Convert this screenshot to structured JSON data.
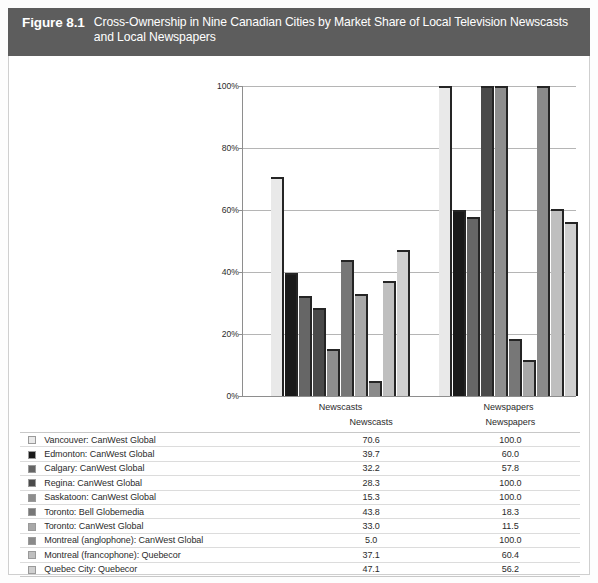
{
  "header": {
    "figure_number": "Figure 8.1",
    "title": "Cross-Ownership in Nine Canadian Cities by Market Share of Local Television Newscasts and Local Newspapers",
    "background_color": "#5d5d5d",
    "text_color": "#ffffff"
  },
  "table": {
    "columns": [
      "",
      "",
      "Newscasts",
      "Newspapers"
    ],
    "newscasts_header": "Newscasts",
    "newspapers_header": "Newspapers",
    "rows": [
      {
        "swatch": "#e9e9e9",
        "label": "Vancouver: CanWest Global",
        "newscasts": "70.6",
        "newspapers": "100.0"
      },
      {
        "swatch": "#1a1a1a",
        "label": "Edmonton: CanWest Global",
        "newscasts": "39.7",
        "newspapers": "60.0"
      },
      {
        "swatch": "#666666",
        "label": "Calgary: CanWest Global",
        "newscasts": "32.2",
        "newspapers": "57.8"
      },
      {
        "swatch": "#4a4a4a",
        "label": "Regina: CanWest Global",
        "newscasts": "28.3",
        "newspapers": "100.0"
      },
      {
        "swatch": "#8e8e8e",
        "label": "Saskatoon: CanWest Global",
        "newscasts": "15.3",
        "newspapers": "100.0"
      },
      {
        "swatch": "#777777",
        "label": "Toronto: Bell Globemedia",
        "newscasts": "43.8",
        "newspapers": "18.3"
      },
      {
        "swatch": "#a8a8a8",
        "label": "Toronto: CanWest Global",
        "newscasts": "33.0",
        "newspapers": "11.5"
      },
      {
        "swatch": "#8a8a8a",
        "label": "Montreal (anglophone): CanWest Global",
        "newscasts": "5.0",
        "newspapers": "100.0"
      },
      {
        "swatch": "#bfbfbf",
        "label": "Montreal (francophone): Quebecor",
        "newscasts": "37.1",
        "newspapers": "60.4"
      },
      {
        "swatch": "#cfcfcf",
        "label": "Quebec City: Quebecor",
        "newscasts": "47.1",
        "newspapers": "56.2"
      }
    ]
  },
  "chart_data": {
    "type": "bar",
    "title": "Cross-Ownership in Nine Canadian Cities by Market Share of Local Television Newscasts and Local Newspapers",
    "xlabel": "",
    "ylabel": "",
    "categories": [
      "Newscasts",
      "Newspapers"
    ],
    "ylim": [
      0,
      100
    ],
    "ytick_labels": [
      "0%",
      "20%",
      "40%",
      "60%",
      "80%",
      "100%"
    ],
    "ytick_values": [
      0,
      20,
      40,
      60,
      80,
      100
    ],
    "grid": true,
    "legend_position": "below-as-table",
    "series": [
      {
        "name": "Vancouver: CanWest Global",
        "color": "#e9e9e9",
        "values": [
          70.6,
          100.0
        ]
      },
      {
        "name": "Edmonton: CanWest Global",
        "color": "#1a1a1a",
        "values": [
          39.7,
          60.0
        ]
      },
      {
        "name": "Calgary: CanWest Global",
        "color": "#666666",
        "values": [
          32.2,
          57.8
        ]
      },
      {
        "name": "Regina: CanWest Global",
        "color": "#4a4a4a",
        "values": [
          28.3,
          100.0
        ]
      },
      {
        "name": "Saskatoon: CanWest Global",
        "color": "#8e8e8e",
        "values": [
          15.3,
          100.0
        ]
      },
      {
        "name": "Toronto: Bell Globemedia",
        "color": "#777777",
        "values": [
          43.8,
          18.3
        ]
      },
      {
        "name": "Toronto: CanWest Global",
        "color": "#a8a8a8",
        "values": [
          33.0,
          11.5
        ]
      },
      {
        "name": "Montreal (anglophone): CanWest Global",
        "color": "#8a8a8a",
        "values": [
          5.0,
          100.0
        ]
      },
      {
        "name": "Montreal (francophone): Quebecor",
        "color": "#bfbfbf",
        "values": [
          37.1,
          60.4
        ]
      },
      {
        "name": "Quebec City: Quebecor",
        "color": "#cfcfcf",
        "values": [
          47.1,
          56.2
        ]
      }
    ]
  }
}
